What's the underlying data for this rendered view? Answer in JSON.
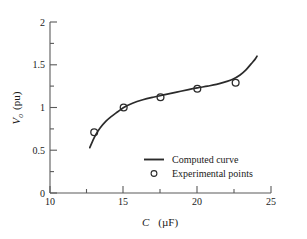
{
  "chart_data": {
    "type": "line",
    "title": "",
    "xlabel": "C   (µF)",
    "xlabel_symbol": "C",
    "xlabel_unit": "(µF)",
    "ylabel": "V₀  (pu)",
    "ylabel_symbol": "V",
    "ylabel_symbol_sub": "o",
    "ylabel_unit": "(pu)",
    "xlim": [
      10,
      25
    ],
    "ylim": [
      0,
      2
    ],
    "xticks": [
      10,
      15,
      20,
      25
    ],
    "xticklabels": [
      "10",
      "15",
      "20",
      "25"
    ],
    "xminorticks": [
      12.5,
      17.5,
      22.5
    ],
    "yticks": [
      0,
      0.5,
      1,
      1.5,
      2
    ],
    "yticklabels": [
      "0",
      "0.5",
      "1",
      "1.5",
      "2"
    ],
    "yminorticks": [
      0.25,
      0.75,
      1.25,
      1.75
    ],
    "grid": false,
    "legend_position": "lower-center",
    "series": [
      {
        "name": "Computed curve",
        "kind": "line",
        "x": [
          12.7,
          12.9,
          13.1,
          13.4,
          13.8,
          14.2,
          14.6,
          15.0,
          15.6,
          16.3,
          17.0,
          17.8,
          18.6,
          19.4,
          20.0,
          20.7,
          21.3,
          21.9,
          22.4,
          22.9,
          23.3,
          23.65,
          23.9,
          24.05
        ],
        "y": [
          0.53,
          0.61,
          0.68,
          0.76,
          0.84,
          0.9,
          0.95,
          1.0,
          1.05,
          1.09,
          1.12,
          1.15,
          1.18,
          1.21,
          1.23,
          1.25,
          1.27,
          1.3,
          1.33,
          1.38,
          1.44,
          1.51,
          1.56,
          1.6
        ]
      },
      {
        "name": "Experimental points",
        "kind": "scatter",
        "marker": "open-circle",
        "x": [
          13.0,
          15.0,
          17.5,
          20.0,
          22.6
        ],
        "y": [
          0.71,
          1.0,
          1.12,
          1.22,
          1.29
        ]
      }
    ],
    "legend": [
      {
        "label": "Computed curve",
        "symbol": "line"
      },
      {
        "label": "Experimental points",
        "symbol": "open-circle"
      }
    ],
    "colors": {
      "line": "#2b2b2b",
      "marker": "#2b2b2b",
      "axis": "#5a5a5a",
      "background": "#ffffff"
    }
  }
}
